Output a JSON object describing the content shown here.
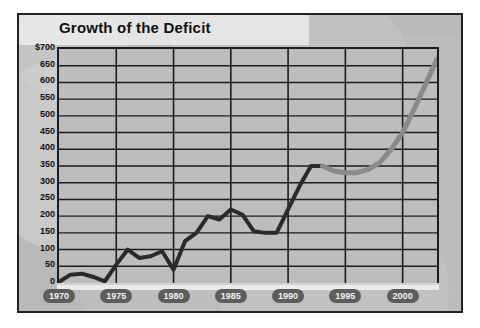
{
  "chart": {
    "title": "Growth of the Deficit",
    "currency_prefix": "$"
  },
  "chart_data": {
    "type": "line",
    "title": "Growth of the Deficit",
    "xlabel": "",
    "ylabel": "",
    "ylim": [
      0,
      700
    ],
    "xlim": [
      1970,
      2003
    ],
    "grid": true,
    "legend": false,
    "ytick_labels": [
      "$700",
      "650",
      "600",
      "550",
      "500",
      "450",
      "400",
      "350",
      "300",
      "250",
      "200",
      "150",
      "100",
      "50",
      "0"
    ],
    "ytick_values": [
      700,
      650,
      600,
      550,
      500,
      450,
      400,
      350,
      300,
      250,
      200,
      150,
      100,
      50,
      0
    ],
    "xtick_labels": [
      "1970",
      "1975",
      "1980",
      "1985",
      "1990",
      "1995",
      "2000"
    ],
    "xtick_values": [
      1970,
      1975,
      1980,
      1985,
      1990,
      1995,
      2000
    ],
    "series": [
      {
        "name": "Actual deficit",
        "color": "#2a2a2a",
        "style": "solid",
        "x": [
          1970,
          1971,
          1972,
          1973,
          1974,
          1975,
          1976,
          1977,
          1978,
          1979,
          1980,
          1981,
          1982,
          1983,
          1984,
          1985,
          1986,
          1987,
          1988,
          1989,
          1990,
          1991,
          1992,
          1993
        ],
        "values": [
          3,
          25,
          28,
          18,
          5,
          55,
          100,
          75,
          80,
          95,
          40,
          125,
          150,
          200,
          190,
          220,
          205,
          155,
          150,
          150,
          220,
          290,
          350,
          350
        ]
      },
      {
        "name": "Projected deficit",
        "color": "#8a8a8a",
        "style": "solid",
        "x": [
          1993,
          1994,
          1995,
          1996,
          1997,
          1998,
          1999,
          2000,
          2001,
          2002,
          2003
        ],
        "values": [
          350,
          335,
          330,
          330,
          340,
          360,
          400,
          450,
          520,
          595,
          670
        ]
      }
    ]
  }
}
